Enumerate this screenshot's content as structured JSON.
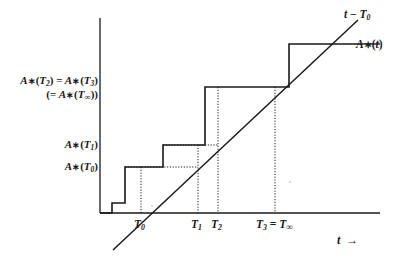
{
  "figure": {
    "kind": "step-function-plot",
    "background_color": "#ffffff",
    "ink_color": "#1a1a1a"
  },
  "axes": {
    "x_axis_label": "t  →",
    "x_axis_label_parts": {
      "variable": "t",
      "arrow": "→"
    },
    "y_axis_label": "",
    "origin_px": {
      "x": 100,
      "y": 213
    },
    "x_axis_end_px": {
      "x": 380,
      "y": 213
    },
    "y_axis_top_px": {
      "x": 100,
      "y": 18
    },
    "x_tick_labels": [
      {
        "id": "T0",
        "text": "T₀",
        "base": "T",
        "sub": "0",
        "x_px": 141
      },
      {
        "id": "T1",
        "text": "T₁",
        "base": "T",
        "sub": "1",
        "x_px": 198
      },
      {
        "id": "T2",
        "text": "T₂",
        "base": "T",
        "sub": "2",
        "x_px": 218
      },
      {
        "id": "T3",
        "text": "T₃ = T∞",
        "base": "T",
        "sub": "3",
        "equals": "=",
        "second_base": "T",
        "second_sub": "∞",
        "x_px": 275
      }
    ],
    "y_tick_labels": [
      {
        "id": "A_T0",
        "text": "A∗(T₀)",
        "y_px": 167
      },
      {
        "id": "A_T1",
        "text": "A∗(T₁)",
        "y_px": 145
      },
      {
        "id": "A_T2_eq_T3",
        "line1": "A∗(T₂) = A∗(T₃)",
        "line2": "(= A∗(T∞))",
        "y_px": 87
      }
    ]
  },
  "curves": [
    {
      "id": "diagonal",
      "label": "t − T₀",
      "label_parts": {
        "variable": "t",
        "minus": "−",
        "base": "T",
        "sub": "0"
      },
      "type": "line",
      "style": "solid",
      "label_px": {
        "x": 344,
        "y": 14
      },
      "points_px": [
        {
          "x": 113,
          "y": 250
        },
        {
          "x": 358,
          "y": 20
        }
      ],
      "crosses_axis_at": "T0"
    },
    {
      "id": "step",
      "label": "A∗(t)",
      "label_parts": {
        "base": "A",
        "star": "∗",
        "arg": "t"
      },
      "type": "step",
      "style": "solid",
      "label_px": {
        "x": 366,
        "y": 44
      },
      "vertices_px": [
        {
          "x": 100,
          "y": 213
        },
        {
          "x": 112,
          "y": 213
        },
        {
          "x": 112,
          "y": 203
        },
        {
          "x": 125,
          "y": 203
        },
        {
          "x": 125,
          "y": 167
        },
        {
          "x": 163,
          "y": 167
        },
        {
          "x": 163,
          "y": 145
        },
        {
          "x": 205,
          "y": 145
        },
        {
          "x": 205,
          "y": 87
        },
        {
          "x": 289,
          "y": 87
        },
        {
          "x": 289,
          "y": 44
        },
        {
          "x": 360,
          "y": 44
        }
      ],
      "leader_line_px": [
        {
          "x": 360,
          "y": 44
        },
        {
          "x": 380,
          "y": 44
        }
      ]
    }
  ],
  "guides": {
    "style": "dotted",
    "vertical_px": [
      {
        "id": "guide-T0",
        "x": 141,
        "y_top": 167,
        "y_bottom": 213
      },
      {
        "id": "guide-T1",
        "x": 198,
        "y_top": 145,
        "y_bottom": 213
      },
      {
        "id": "guide-T2",
        "x": 218,
        "y_top": 87,
        "y_bottom": 213
      },
      {
        "id": "guide-T3",
        "x": 275,
        "y_top": 87,
        "y_bottom": 213
      }
    ],
    "horizontal_px": [
      {
        "id": "guide-A-T0",
        "y": 167,
        "x_left": 125,
        "x_right": 198
      },
      {
        "id": "guide-A-T1",
        "y": 145,
        "x_left": 163,
        "x_right": 218
      }
    ]
  },
  "chart_data": {
    "type": "line",
    "title": "",
    "xlabel": "t",
    "ylabel": "",
    "grid": false,
    "legend": "inline-right",
    "annotations": [
      {
        "text": "t − T₀",
        "target": "diagonal"
      },
      {
        "text": "A∗(t)",
        "target": "step"
      }
    ],
    "series": [
      {
        "name": "A∗(t)",
        "type": "step",
        "x": [
          "s0",
          "T0-",
          "T0",
          "T1",
          "T2",
          "T3"
        ],
        "step_levels": [
          0,
          1,
          2,
          3,
          5,
          7
        ],
        "note": "right-continuous increasing step function, jumps before each T_i"
      },
      {
        "name": "t − T₀",
        "type": "line",
        "x": [
          "left",
          "right"
        ],
        "y": [
          "below-axis",
          "above-top-step"
        ],
        "note": "straight line of slope 1 crossing the t-axis at T₀"
      }
    ],
    "marked_x_values": [
      "T₀",
      "T₁",
      "T₂",
      "T₃ = T∞"
    ],
    "marked_y_values": [
      "A∗(T₀)",
      "A∗(T₁)",
      "A∗(T₂) = A∗(T₃) (= A∗(T∞))"
    ]
  }
}
